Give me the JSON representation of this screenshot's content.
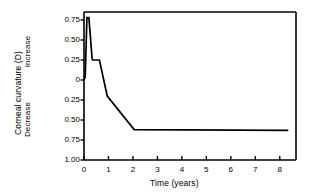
{
  "chart_data": {
    "type": "line",
    "title": "",
    "xlabel": "Time (years)",
    "ylabel": "Corneal curvature (D)",
    "ylabel_upper_half": "Increase",
    "ylabel_lower_half": "Decrease",
    "xlim": [
      0,
      8.5
    ],
    "ylim": [
      -1.0,
      0.85
    ],
    "grid": false,
    "legend": "none",
    "xticks": [
      0,
      1,
      2,
      3,
      4,
      5,
      6,
      7,
      8
    ],
    "xtick_labels": [
      "0",
      "1",
      "2",
      "3",
      "4",
      "5",
      "6",
      "7",
      "8"
    ],
    "yticks": [
      0.75,
      0.5,
      0.25,
      0,
      -0.25,
      -0.5,
      -0.75,
      -1.0
    ],
    "ytick_labels": [
      "0.75",
      "0.50",
      "0.25",
      "0",
      "0.25",
      "0.50",
      "0.75",
      "1.00"
    ],
    "series": [
      {
        "name": "Corneal curvature change",
        "x": [
          0.0,
          0.05,
          0.12,
          0.2,
          0.33,
          0.35,
          0.63,
          0.65,
          0.95,
          2.05,
          8.35
        ],
        "y": [
          0.0,
          0.04,
          0.78,
          0.78,
          0.27,
          0.25,
          0.25,
          0.22,
          -0.2,
          -0.62,
          -0.63
        ]
      }
    ],
    "annotations": []
  },
  "figure": {
    "frame_color": "#000000",
    "line_color": "#000000",
    "background": "#ffffff"
  }
}
